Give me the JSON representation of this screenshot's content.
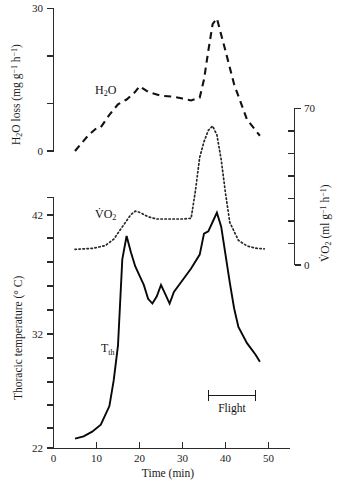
{
  "chart_data": {
    "type": "line",
    "title": "",
    "xlabel": "Time (min)",
    "xlim": [
      0,
      50
    ],
    "x_ticks": [
      0,
      10,
      20,
      30,
      40,
      50
    ],
    "x_tick_labels": [
      "0",
      "10",
      "20",
      "30",
      "40",
      "50"
    ],
    "grid": false,
    "legend_position": "inline-labels",
    "panels": [
      {
        "name": "upper-panel",
        "ylabel_left": "H₂O loss (mg g⁻¹ h⁻¹)",
        "ylim_left": [
          0,
          30
        ],
        "y_ticks_left": [
          0,
          10,
          20,
          30
        ],
        "y_tick_labels_left": [
          "0",
          "",
          "",
          "30"
        ],
        "ylabel_right": "V̇O₂ (ml g⁻¹ h⁻¹)",
        "ylim_right": [
          0,
          70
        ],
        "y_ticks_right": [
          0,
          10,
          20,
          30,
          40,
          50,
          60,
          70
        ],
        "y_tick_labels_right": [
          "0",
          "",
          "",
          "",
          "",
          "",
          "",
          "70"
        ]
      },
      {
        "name": "lower-panel",
        "ylabel_left": "Thoracic temperature (° C)",
        "ylim_left": [
          22,
          43
        ],
        "y_ticks_left": [
          22,
          24,
          26,
          28,
          30,
          32,
          34,
          36,
          38,
          40,
          42
        ],
        "y_tick_labels_left": [
          "22",
          "",
          "",
          "",
          "",
          "32",
          "",
          "",
          "",
          "",
          "42"
        ]
      }
    ],
    "series": [
      {
        "name": "H2O",
        "label": "H₂O",
        "style": "dashed",
        "axis": "left-upper",
        "units": "mg g⁻¹ h⁻¹",
        "x": [
          5,
          8,
          10,
          11,
          13,
          15,
          17,
          19,
          20,
          22,
          25,
          28,
          30,
          32,
          34,
          35,
          36,
          37,
          38,
          40,
          42,
          45,
          48
        ],
        "y": [
          0.0,
          3.2,
          4.8,
          5.0,
          7.6,
          9.8,
          10.8,
          12.4,
          13.6,
          12.4,
          11.6,
          11.4,
          11.0,
          10.6,
          11.2,
          15.0,
          21.0,
          26.6,
          27.8,
          21.0,
          14.0,
          6.6,
          3.2
        ]
      },
      {
        "name": "VO2",
        "label": "V̇O₂",
        "style": "dotted",
        "axis": "right-upper",
        "units": "ml g⁻¹ h⁻¹",
        "x": [
          5,
          9,
          12,
          14,
          16,
          18,
          19,
          20,
          22,
          24,
          26,
          28,
          30,
          32,
          33,
          34,
          35,
          36,
          37,
          38,
          39,
          40,
          41,
          43,
          45,
          47,
          49
        ],
        "y": [
          7.0,
          7.4,
          8.6,
          11.5,
          17.0,
          22.5,
          24.0,
          23.5,
          21.5,
          20.5,
          20.5,
          20.5,
          20.5,
          20.8,
          33.0,
          48.0,
          55.0,
          60.0,
          62.0,
          58.0,
          47.0,
          32.0,
          19.0,
          11.0,
          8.5,
          7.5,
          7.2
        ]
      },
      {
        "name": "Tth",
        "label": "Tₜₕ",
        "style": "solid",
        "axis": "left-lower",
        "units": "°C",
        "x": [
          5,
          7,
          9,
          11,
          13,
          14,
          15,
          16,
          17,
          18,
          19,
          20,
          21,
          22,
          23,
          24,
          25,
          26,
          27,
          28,
          30,
          32,
          34,
          35,
          36,
          37,
          38,
          39,
          40,
          41,
          42,
          43,
          45,
          47,
          48
        ],
        "y": [
          22.8,
          23.0,
          23.4,
          24.0,
          25.6,
          27.8,
          30.8,
          38.2,
          40.2,
          38.8,
          37.6,
          36.8,
          36.0,
          34.8,
          34.4,
          35.0,
          36.0,
          35.2,
          34.4,
          35.4,
          36.4,
          37.4,
          38.6,
          40.4,
          40.6,
          41.4,
          42.2,
          41.0,
          38.6,
          36.2,
          34.0,
          32.4,
          31.0,
          30.0,
          29.4
        ]
      }
    ],
    "annotations": [
      {
        "name": "flight-period",
        "label": "Flight",
        "x_start": 36,
        "x_end": 47,
        "type": "range-bracket"
      }
    ]
  },
  "labels": {
    "h2o_series": "H₂O",
    "vo2_series": "V̇O₂",
    "tth_series": "Tₜₕ",
    "flight": "Flight",
    "x_axis_title": "Time (min)",
    "y_axis_title_h2o": "H₂O loss (mg g⁻¹ h⁻¹)",
    "y_axis_title_vo2": "V̇O₂ (ml g⁻¹ h⁻¹)",
    "y_axis_title_temp": "Thoracic temperature (° C)"
  },
  "ticks": {
    "x": [
      "0",
      "10",
      "20",
      "30",
      "40",
      "50"
    ],
    "h2o_top": "30",
    "h2o_bottom": "0",
    "vo2_top": "70",
    "vo2_bottom": "0",
    "temp_top": "42",
    "temp_mid": "32",
    "temp_bottom": "22"
  },
  "colors": {
    "ink": "#111111",
    "background": "#ffffff",
    "axis": "#2b2b2b"
  }
}
